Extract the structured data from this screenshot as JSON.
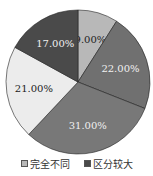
{
  "chart_data": {
    "type": "pie",
    "title": "",
    "start_angle_deg": 0,
    "direction": "clockwise",
    "slices": [
      {
        "label": "",
        "value": 9.0,
        "text": "9.00%",
        "color": "#b8b8b8",
        "text_color": "#222"
      },
      {
        "label": "",
        "value": 22.0,
        "text": "22.00%",
        "color": "#707070",
        "text_color": "#f0f0f0"
      },
      {
        "label": "",
        "value": 31.0,
        "text": "31.00%",
        "color": "#787878",
        "text_color": "#f0f0f0"
      },
      {
        "label": "",
        "value": 21.0,
        "text": "21.00%",
        "color": "#ececec",
        "text_color": "#222"
      },
      {
        "label": "",
        "value": 17.0,
        "text": "17.00%",
        "color": "#4a4a4a",
        "text_color": "#f0f0f0"
      }
    ],
    "legend": [
      {
        "label": "完全不同",
        "color": "#b8b8b8"
      },
      {
        "label": "区分较大",
        "color": "#4a4a4a"
      }
    ],
    "legend_position": "bottom"
  }
}
